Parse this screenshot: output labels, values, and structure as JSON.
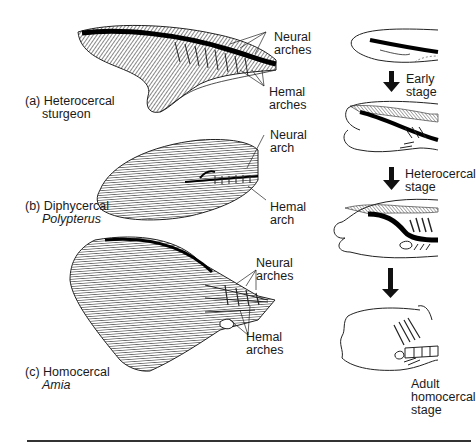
{
  "figure": {
    "panels": [
      {
        "id": "a",
        "prefix": "(a)",
        "type_label": "Heterocercal",
        "taxon": "sturgeon",
        "taxon_italic": false,
        "annotations": [
          {
            "line1": "Neural",
            "line2": "arches"
          },
          {
            "line1": "Hemal",
            "line2": "arches"
          }
        ]
      },
      {
        "id": "b",
        "prefix": "(b)",
        "type_label": "Diphycercal",
        "taxon": "Polypterus",
        "taxon_italic": true,
        "annotations": [
          {
            "line1": "Neural",
            "line2": "arch"
          },
          {
            "line1": "Hemal",
            "line2": "arch"
          }
        ]
      },
      {
        "id": "c",
        "prefix": "(c)",
        "type_label": "Homocercal",
        "taxon": "Amia",
        "taxon_italic": true,
        "annotations": [
          {
            "line1": "Neural",
            "line2": "arches"
          },
          {
            "line1": "Hemal",
            "line2": "arches"
          }
        ]
      }
    ],
    "development_sequence": {
      "stages": [
        {
          "line1": "Early",
          "line2": "stage"
        },
        {
          "line1": "Heterocercal",
          "line2": "stage"
        },
        {
          "line1": "Adult",
          "line2": "homocercal",
          "line3": "stage"
        }
      ]
    },
    "colors": {
      "ink": "#1a1a1a",
      "background": "#ffffff"
    }
  }
}
